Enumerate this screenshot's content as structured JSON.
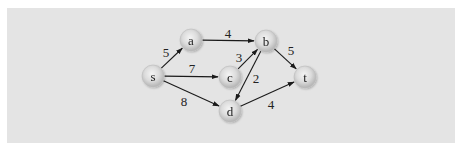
{
  "figure": {
    "type": "weighted directed graph",
    "colors": {
      "page_background": "#ffffff",
      "panel_background": "#e4e4e4",
      "node_fill_center": "#f2f2f2",
      "node_fill_edge": "#b5b5b5",
      "edge_color": "#1a1a1a",
      "text_color": "#222222"
    }
  },
  "nodes": [
    {
      "id": "s",
      "label": "s",
      "x": 153,
      "y": 76
    },
    {
      "id": "a",
      "label": "a",
      "x": 191,
      "y": 40
    },
    {
      "id": "b",
      "label": "b",
      "x": 266,
      "y": 41
    },
    {
      "id": "c",
      "label": "c",
      "x": 230,
      "y": 77
    },
    {
      "id": "d",
      "label": "d",
      "x": 230,
      "y": 111
    },
    {
      "id": "t",
      "label": "t",
      "x": 305,
      "y": 77
    }
  ],
  "edges": [
    {
      "from": "s",
      "to": "a",
      "weight": "5",
      "label_x": 166,
      "label_y": 52
    },
    {
      "from": "a",
      "to": "b",
      "weight": "4",
      "label_x": 228,
      "label_y": 33
    },
    {
      "from": "s",
      "to": "c",
      "weight": "7",
      "label_x": 192,
      "label_y": 68
    },
    {
      "from": "c",
      "to": "b",
      "weight": "3",
      "label_x": 239,
      "label_y": 57
    },
    {
      "from": "b",
      "to": "t",
      "weight": "5",
      "label_x": 291,
      "label_y": 50
    },
    {
      "from": "b",
      "to": "d",
      "weight": "2",
      "label_x": 256,
      "label_y": 78
    },
    {
      "from": "s",
      "to": "d",
      "weight": "8",
      "label_x": 184,
      "label_y": 101
    },
    {
      "from": "d",
      "to": "t",
      "weight": "4",
      "label_x": 271,
      "label_y": 104
    }
  ]
}
